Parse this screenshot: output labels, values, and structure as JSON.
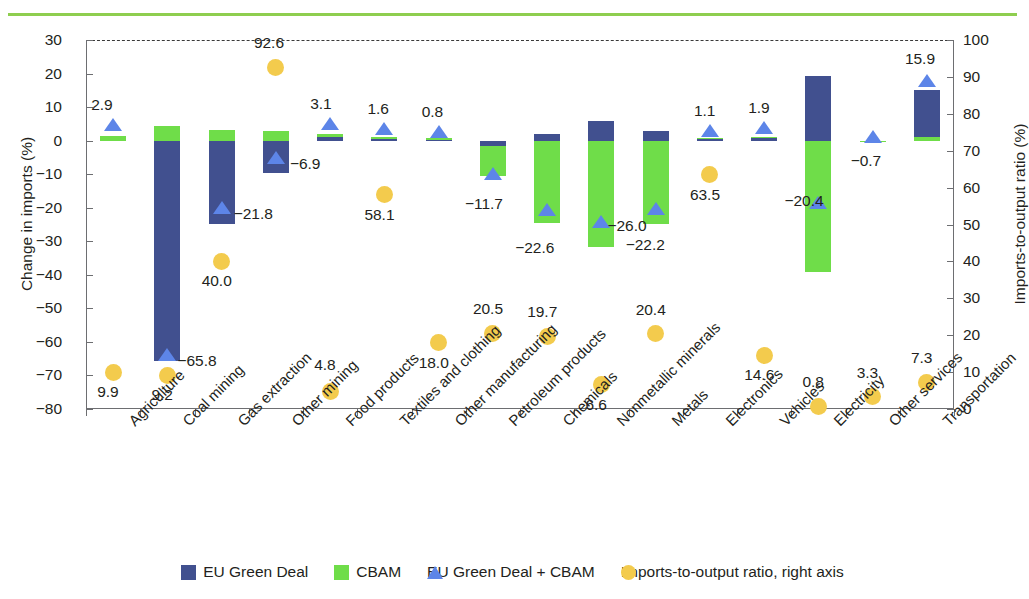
{
  "chart_data": {
    "type": "bar",
    "title": "",
    "subtitle": "",
    "xlabel": "",
    "ylabel": "Change in imports (%)",
    "ylabel_right": "Imports-to-output ratio (%)",
    "ylim": [
      -80,
      30
    ],
    "ylim_right": [
      0,
      100
    ],
    "yticks": [
      30,
      20,
      10,
      0,
      -10,
      -20,
      -30,
      -40,
      -50,
      -60,
      -70,
      -80
    ],
    "yticks_right": [
      100,
      90,
      80,
      70,
      60,
      50,
      40,
      30,
      20,
      10,
      0
    ],
    "grid": false,
    "legend_position": "bottom",
    "categories": [
      "Agriculture",
      "Coal mining",
      "Gas extraction",
      "Other mining",
      "Food products",
      "Textiles and clothing",
      "Other manufacturing",
      "Petroleum products",
      "Chemicals",
      "Nonmetallic minerals",
      "Metals",
      "Electronics",
      "Vehicles",
      "Electricity",
      "Other services",
      "Transportation"
    ],
    "series": [
      {
        "name": "EU Green Deal",
        "color": "#41508f",
        "axis": "left",
        "values": [
          1.5,
          -65.8,
          -24.8,
          -9.6,
          1.2,
          0.6,
          0.2,
          -1.6,
          1.9,
          5.9,
          3.0,
          0.5,
          0.9,
          19.4,
          -0.4,
          15.0
        ]
      },
      {
        "name": "CBAM",
        "color": "#6fdd49",
        "axis": "left",
        "values": [
          1.4,
          4.5,
          3.2,
          3.0,
          2.1,
          1.2,
          0.8,
          -10.4,
          -24.5,
          -31.8,
          -25.0,
          0.7,
          1.1,
          -39.2,
          -0.4,
          1.2
        ]
      },
      {
        "name": "EU Green Deal + CBAM",
        "color": "#5d85e8",
        "marker": "triangle",
        "axis": "left",
        "values": [
          2.9,
          -65.8,
          -21.8,
          -6.9,
          3.1,
          1.6,
          0.8,
          -11.7,
          -22.6,
          -26.0,
          -22.2,
          1.1,
          1.9,
          -20.4,
          -0.7,
          15.9
        ]
      },
      {
        "name": "Imports-to-output ratio, right axis",
        "color": "#f3cb4d",
        "marker": "circle",
        "axis": "right",
        "values": [
          9.9,
          9.2,
          40.0,
          92.6,
          4.8,
          58.1,
          18.0,
          20.5,
          19.7,
          6.6,
          20.4,
          63.5,
          14.6,
          0.8,
          3.3,
          7.3
        ]
      }
    ],
    "data_labels_combined": [
      "2.9",
      "−65.8",
      "−21.8",
      "−6.9",
      "3.1",
      "1.6",
      "0.8",
      "−11.7",
      "−22.6",
      "−26.0",
      "−22.2",
      "1.1",
      "1.9",
      "−20.4",
      "−0.7",
      "15.9"
    ],
    "data_labels_ratio": [
      "9.9",
      "9.2",
      "40.0",
      "92.6",
      "4.8",
      "58.1",
      "18.0",
      "20.5",
      "19.7",
      "6.6",
      "20.4",
      "63.5",
      "14.6",
      "0.8",
      "3.3",
      "7.3"
    ]
  },
  "legend": {
    "items": [
      {
        "label": "EU Green Deal",
        "marker": "square-navy"
      },
      {
        "label": "CBAM",
        "marker": "square-green"
      },
      {
        "label": "EU Green Deal + CBAM",
        "marker": "triangle-blue"
      },
      {
        "label": "Imports-to-output ratio, right axis",
        "marker": "circle-yellow"
      }
    ]
  },
  "colors": {
    "eu_green_deal": "#41508f",
    "cbam": "#6fdd49",
    "combined": "#5d85e8",
    "ratio": "#f3cb4d",
    "rule": "#8ece4f",
    "axis": "#6d6e71",
    "text": "#231f20"
  }
}
